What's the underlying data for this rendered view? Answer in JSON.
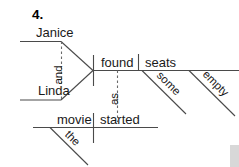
{
  "exercise": {
    "number_label": "4."
  },
  "diagram": {
    "type": "reed-kellogg-sentence-diagram",
    "sentence": "Janice and Linda found some empty seats as the movie started",
    "ink_color": "#4a4a4a",
    "text_color": "#1a1a1a",
    "background_color": "#ffffff",
    "subject_compound": {
      "conjunction": "and",
      "members": [
        {
          "word": "Janice",
          "role": "subject",
          "x": 36,
          "y": 36
        },
        {
          "word": "Linda",
          "role": "subject",
          "x": 38,
          "y": 95
        }
      ]
    },
    "main_clause": {
      "verb": {
        "word": "found",
        "role": "predicate-verb",
        "x": 101,
        "y": 67
      },
      "direct_object": {
        "word": "seats",
        "role": "direct-object",
        "x": 145,
        "y": 67
      },
      "modifiers": [
        {
          "word": "some",
          "role": "adjective",
          "modifies": "seats"
        },
        {
          "word": "empty",
          "role": "adjective",
          "modifies": "seats"
        }
      ]
    },
    "subordinate_clause": {
      "connector": "as",
      "subject": {
        "word": "movie",
        "role": "subject",
        "x": 57,
        "y": 124
      },
      "verb": {
        "word": "started",
        "role": "predicate-verb",
        "x": 100,
        "y": 124
      },
      "modifiers": [
        {
          "word": "the",
          "role": "article",
          "modifies": "movie"
        }
      ]
    },
    "labels": {
      "janice": "Janice",
      "linda": "Linda",
      "and": "and",
      "found": "found",
      "seats": "seats",
      "some": "some",
      "empty": "empty",
      "as": "as",
      "movie": "movie",
      "started": "started",
      "the": "the"
    }
  }
}
